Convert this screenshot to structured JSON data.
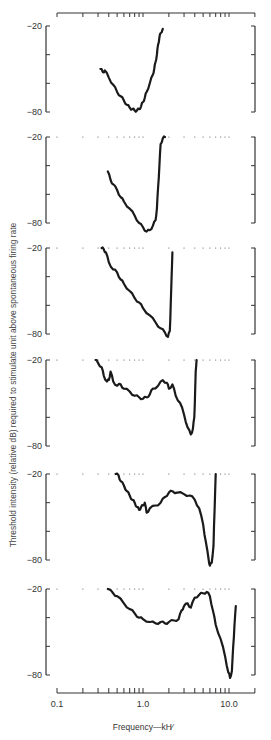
{
  "chart_data": {
    "type": "line",
    "title": "",
    "xlabel": "Frequency—kHz",
    "ylabel": "Threshold intensity (relative dB) required to stimulate unit above spontaneous firing rate",
    "xscale": "log",
    "xlim": [
      0.1,
      20
    ],
    "x_tick_labels": [
      "0.1",
      "1.0",
      "10.0"
    ],
    "y_tick_labels": [
      "-20",
      "-80"
    ],
    "ylim": [
      -80,
      -20
    ],
    "grid": false,
    "legend": null,
    "panels": [
      {
        "name": "panel-1",
        "points": [
          [
            0.32,
            -50
          ],
          [
            0.34,
            -52
          ],
          [
            0.36,
            -51
          ],
          [
            0.4,
            -56
          ],
          [
            0.45,
            -61
          ],
          [
            0.5,
            -66
          ],
          [
            0.55,
            -69
          ],
          [
            0.6,
            -72
          ],
          [
            0.65,
            -75
          ],
          [
            0.7,
            -77
          ],
          [
            0.75,
            -78
          ],
          [
            0.8,
            -79
          ],
          [
            0.85,
            -79
          ],
          [
            0.9,
            -78
          ],
          [
            0.95,
            -76
          ],
          [
            1.0,
            -73
          ],
          [
            1.05,
            -70
          ],
          [
            1.1,
            -66
          ],
          [
            1.2,
            -60
          ],
          [
            1.3,
            -54
          ],
          [
            1.35,
            -50
          ],
          [
            1.4,
            -45
          ],
          [
            1.45,
            -40
          ],
          [
            1.5,
            -33
          ],
          [
            1.55,
            -28
          ],
          [
            1.6,
            -25
          ],
          [
            1.7,
            -22
          ]
        ]
      },
      {
        "name": "panel-2",
        "points": [
          [
            0.39,
            -44
          ],
          [
            0.42,
            -50
          ],
          [
            0.45,
            -53
          ],
          [
            0.5,
            -57
          ],
          [
            0.55,
            -62
          ],
          [
            0.6,
            -65
          ],
          [
            0.7,
            -70
          ],
          [
            0.8,
            -75
          ],
          [
            0.9,
            -80
          ],
          [
            1.0,
            -83
          ],
          [
            1.1,
            -86
          ],
          [
            1.2,
            -85
          ],
          [
            1.3,
            -82
          ],
          [
            1.4,
            -78
          ],
          [
            1.45,
            -70
          ],
          [
            1.5,
            -55
          ],
          [
            1.55,
            -40
          ],
          [
            1.6,
            -25
          ],
          [
            1.7,
            -21
          ],
          [
            1.8,
            -20
          ]
        ]
      },
      {
        "name": "panel-3",
        "points": [
          [
            0.33,
            -20
          ],
          [
            0.35,
            -21
          ],
          [
            0.37,
            -23
          ],
          [
            0.4,
            -30
          ],
          [
            0.45,
            -35
          ],
          [
            0.5,
            -37
          ],
          [
            0.55,
            -42
          ],
          [
            0.6,
            -45
          ],
          [
            0.7,
            -50
          ],
          [
            0.8,
            -55
          ],
          [
            0.9,
            -58
          ],
          [
            1.0,
            -62
          ],
          [
            1.2,
            -67
          ],
          [
            1.4,
            -72
          ],
          [
            1.6,
            -76
          ],
          [
            1.8,
            -79
          ],
          [
            1.95,
            -82
          ],
          [
            2.05,
            -78
          ],
          [
            2.1,
            -60
          ],
          [
            2.15,
            -40
          ],
          [
            2.2,
            -23
          ]
        ]
      },
      {
        "name": "panel-4",
        "points": [
          [
            0.28,
            -20
          ],
          [
            0.3,
            -22
          ],
          [
            0.33,
            -25
          ],
          [
            0.35,
            -31
          ],
          [
            0.38,
            -35
          ],
          [
            0.4,
            -34
          ],
          [
            0.42,
            -28
          ],
          [
            0.45,
            -35
          ],
          [
            0.5,
            -38
          ],
          [
            0.55,
            -37
          ],
          [
            0.6,
            -40
          ],
          [
            0.7,
            -42
          ],
          [
            0.8,
            -45
          ],
          [
            0.9,
            -46
          ],
          [
            1.0,
            -47
          ],
          [
            1.1,
            -46
          ],
          [
            1.2,
            -44
          ],
          [
            1.3,
            -40
          ],
          [
            1.5,
            -38
          ],
          [
            1.7,
            -34
          ],
          [
            1.9,
            -36
          ],
          [
            2.0,
            -40
          ],
          [
            2.2,
            -37
          ],
          [
            2.4,
            -45
          ],
          [
            2.7,
            -50
          ],
          [
            3.0,
            -58
          ],
          [
            3.3,
            -67
          ],
          [
            3.6,
            -72
          ],
          [
            3.8,
            -68
          ],
          [
            3.95,
            -60
          ],
          [
            4.05,
            -40
          ],
          [
            4.1,
            -28
          ],
          [
            4.2,
            -20
          ]
        ]
      },
      {
        "name": "panel-5",
        "points": [
          [
            0.48,
            -20
          ],
          [
            0.52,
            -21
          ],
          [
            0.55,
            -25
          ],
          [
            0.6,
            -28
          ],
          [
            0.65,
            -32
          ],
          [
            0.7,
            -35
          ],
          [
            0.75,
            -38
          ],
          [
            0.8,
            -40
          ],
          [
            0.85,
            -43
          ],
          [
            0.9,
            -45
          ],
          [
            0.95,
            -43
          ],
          [
            1.0,
            -42
          ],
          [
            1.05,
            -40
          ],
          [
            1.1,
            -47
          ],
          [
            1.2,
            -44
          ],
          [
            1.4,
            -42
          ],
          [
            1.6,
            -40
          ],
          [
            1.8,
            -36
          ],
          [
            2.0,
            -33
          ],
          [
            2.2,
            -32
          ],
          [
            2.5,
            -33
          ],
          [
            3.0,
            -34
          ],
          [
            3.5,
            -35
          ],
          [
            4.0,
            -38
          ],
          [
            4.5,
            -44
          ],
          [
            5.0,
            -55
          ],
          [
            5.4,
            -68
          ],
          [
            5.8,
            -80
          ],
          [
            6.0,
            -84
          ],
          [
            6.3,
            -82
          ],
          [
            6.6,
            -70
          ],
          [
            6.8,
            -45
          ],
          [
            7.0,
            -20
          ]
        ]
      },
      {
        "name": "panel-6",
        "points": [
          [
            0.39,
            -20
          ],
          [
            0.45,
            -23
          ],
          [
            0.5,
            -25
          ],
          [
            0.6,
            -30
          ],
          [
            0.7,
            -34
          ],
          [
            0.8,
            -37
          ],
          [
            0.9,
            -40
          ],
          [
            1.0,
            -41
          ],
          [
            1.2,
            -43
          ],
          [
            1.4,
            -44
          ],
          [
            1.6,
            -43
          ],
          [
            1.8,
            -44
          ],
          [
            2.0,
            -43
          ],
          [
            2.3,
            -42
          ],
          [
            2.6,
            -41
          ],
          [
            2.8,
            -35
          ],
          [
            3.0,
            -32
          ],
          [
            3.3,
            -30
          ],
          [
            3.6,
            -33
          ],
          [
            4.0,
            -26
          ],
          [
            4.5,
            -24
          ],
          [
            5.0,
            -23
          ],
          [
            5.5,
            -22
          ],
          [
            6.0,
            -25
          ],
          [
            6.5,
            -35
          ],
          [
            7.0,
            -45
          ],
          [
            8.0,
            -55
          ],
          [
            9.0,
            -67
          ],
          [
            9.8,
            -78
          ],
          [
            10.3,
            -82
          ],
          [
            10.8,
            -77
          ],
          [
            11.2,
            -60
          ],
          [
            11.6,
            -45
          ],
          [
            12.0,
            -32
          ]
        ]
      }
    ]
  },
  "axes": {
    "x_ticks": [
      0.1,
      0.2,
      0.3,
      0.4,
      0.5,
      0.6,
      0.7,
      0.8,
      0.9,
      1.0,
      2,
      3,
      4,
      5,
      6,
      7,
      8,
      9,
      10,
      20
    ],
    "x_tick_labels": [
      {
        "v": 0.1,
        "label": "0.1"
      },
      {
        "v": 1.0,
        "label": "1.0"
      },
      {
        "v": 10,
        "label": "10.0"
      }
    ],
    "y_top_label": "-20",
    "y_bottom_label": "-80"
  },
  "labels": {
    "ylabel": "Threshold intensity (relative dB) required to stimulate unit above spontaneous firing rate",
    "xlabel": "Frequency—kH⁄"
  },
  "colors": {
    "curve": "#1a1a1a",
    "axis": "#333333"
  }
}
